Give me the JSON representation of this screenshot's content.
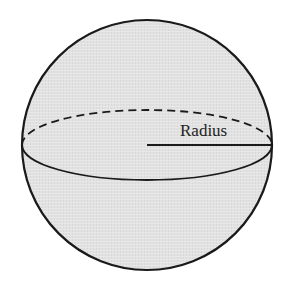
{
  "diagram": {
    "labels": {
      "radius": "Radius"
    },
    "colors": {
      "background": "#ffffff",
      "sphere_fill": "#e2e2e2",
      "stroke": "#1a1a1a"
    },
    "sphere": {
      "cx": 147,
      "cy": 145,
      "r": 125
    },
    "equator": {
      "rx": 125,
      "ry": 35,
      "front_style": "solid",
      "back_style": "dashed"
    },
    "radius_line": {
      "x1": 147,
      "y1": 145,
      "x2": 272,
      "y2": 145
    }
  }
}
